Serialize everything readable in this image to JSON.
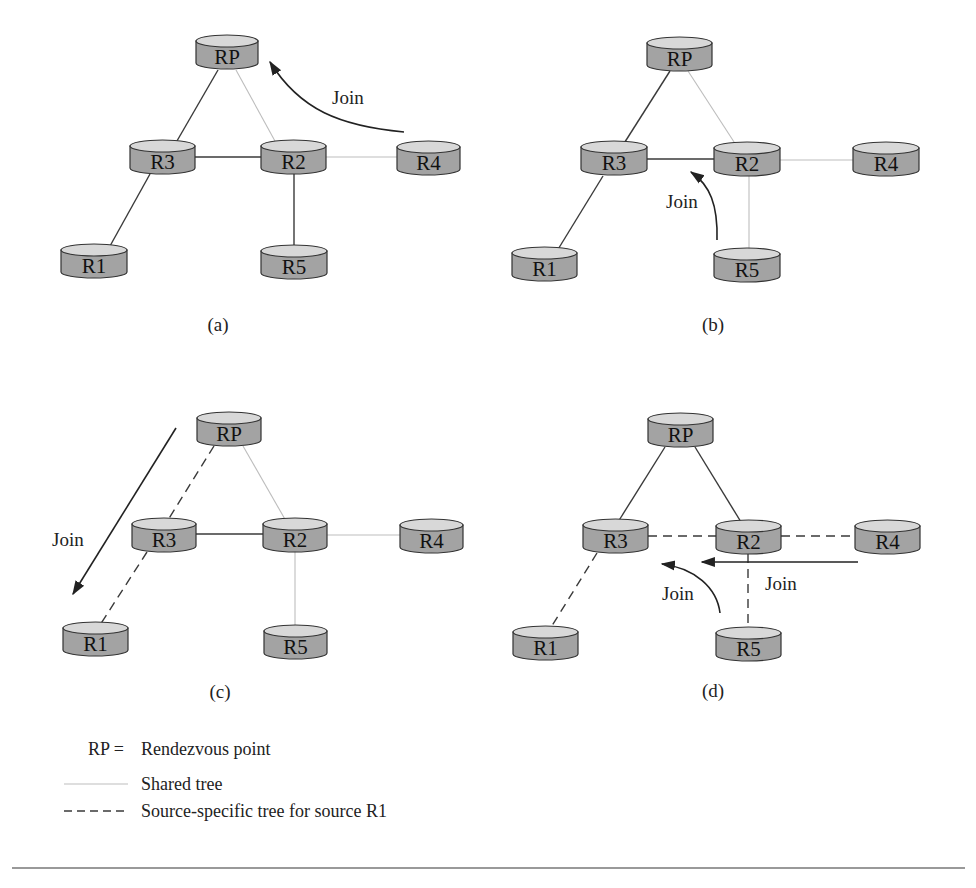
{
  "panels": [
    {
      "id": "a",
      "caption": "(a)",
      "caption_pos": [
        218,
        331
      ],
      "nodes": [
        {
          "id": "RP",
          "label": "RP",
          "x": 196,
          "y": 35,
          "w": 62
        },
        {
          "id": "R3",
          "label": "R3",
          "x": 130,
          "y": 140,
          "w": 65
        },
        {
          "id": "R2",
          "label": "R2",
          "x": 261,
          "y": 140,
          "w": 65
        },
        {
          "id": "R4",
          "label": "R4",
          "x": 397,
          "y": 141,
          "w": 63
        },
        {
          "id": "R1",
          "label": "R1",
          "x": 61,
          "y": 244,
          "w": 66
        },
        {
          "id": "R5",
          "label": "R5",
          "x": 261,
          "y": 245,
          "w": 66
        }
      ],
      "links": [
        {
          "from": "RP",
          "to": "R3",
          "style": "solid",
          "p": [
            218,
            70,
            170,
            153
          ]
        },
        {
          "from": "RP",
          "to": "R2",
          "style": "shared",
          "p": [
            236,
            70,
            281,
            152
          ]
        },
        {
          "from": "R3",
          "to": "R2",
          "style": "solid",
          "p": [
            195,
            157,
            261,
            157
          ]
        },
        {
          "from": "R2",
          "to": "R4",
          "style": "shared",
          "p": [
            326,
            157,
            397,
            157
          ]
        },
        {
          "from": "R2",
          "to": "R5",
          "style": "solid",
          "p": [
            294,
            174,
            294,
            255
          ]
        },
        {
          "from": "R3",
          "to": "R1",
          "style": "solid",
          "p": [
            150,
            174,
            105,
            255
          ]
        }
      ],
      "arrows": [
        {
          "label": "Join",
          "path": "M404,132 C340,126 300,110 270,62",
          "tip": [
            268,
            59
          ],
          "angle": -118,
          "label_pos": [
            332,
            104
          ]
        }
      ]
    },
    {
      "id": "b",
      "caption": "(b)",
      "caption_pos": [
        713,
        331
      ],
      "nodes": [
        {
          "id": "RP",
          "label": "RP",
          "x": 647,
          "y": 37,
          "w": 65
        },
        {
          "id": "R3",
          "label": "R3",
          "x": 581,
          "y": 141,
          "w": 66
        },
        {
          "id": "R2",
          "label": "R2",
          "x": 714,
          "y": 142,
          "w": 66
        },
        {
          "id": "R4",
          "label": "R4",
          "x": 853,
          "y": 142,
          "w": 66
        },
        {
          "id": "R1",
          "label": "R1",
          "x": 512,
          "y": 247,
          "w": 65
        },
        {
          "id": "R5",
          "label": "R5",
          "x": 714,
          "y": 248,
          "w": 66
        }
      ],
      "links": [
        {
          "from": "RP",
          "to": "R3",
          "style": "solid",
          "p": [
            670,
            71,
            623,
            145
          ]
        },
        {
          "from": "RP",
          "to": "R2",
          "style": "shared",
          "p": [
            688,
            71,
            736,
            145
          ]
        },
        {
          "from": "R3",
          "to": "R2",
          "style": "solid",
          "p": [
            647,
            159,
            714,
            159
          ]
        },
        {
          "from": "R2",
          "to": "R4",
          "style": "shared",
          "p": [
            780,
            160,
            853,
            160
          ]
        },
        {
          "from": "R2",
          "to": "R5",
          "style": "shared",
          "p": [
            749,
            176,
            749,
            252
          ]
        },
        {
          "from": "R3",
          "to": "R1",
          "style": "solid",
          "p": [
            603,
            176,
            557,
            251
          ]
        }
      ],
      "arrows": [
        {
          "label": "Join",
          "path": "M717,240 C718,205 710,185 691,172",
          "tip": [
            688,
            169
          ],
          "angle": -140,
          "label_pos": [
            666,
            208
          ]
        }
      ]
    },
    {
      "id": "c",
      "caption": "(c)",
      "caption_pos": [
        220,
        698
      ],
      "nodes": [
        {
          "id": "RP",
          "label": "RP",
          "x": 197,
          "y": 412,
          "w": 64
        },
        {
          "id": "R3",
          "label": "R3",
          "x": 132,
          "y": 518,
          "w": 64
        },
        {
          "id": "R2",
          "label": "R2",
          "x": 263,
          "y": 518,
          "w": 64
        },
        {
          "id": "R4",
          "label": "R4",
          "x": 400,
          "y": 519,
          "w": 63
        },
        {
          "id": "R1",
          "label": "R1",
          "x": 63,
          "y": 622,
          "w": 65
        },
        {
          "id": "R5",
          "label": "R5",
          "x": 264,
          "y": 625,
          "w": 63
        }
      ],
      "links": [
        {
          "from": "RP",
          "to": "R3",
          "style": "dashed",
          "p": [
            214,
            446,
            168,
            520
          ]
        },
        {
          "from": "RP",
          "to": "R2",
          "style": "shared",
          "p": [
            243,
            446,
            286,
            521
          ]
        },
        {
          "from": "R3",
          "to": "R2",
          "style": "solid",
          "p": [
            196,
            534,
            263,
            534
          ]
        },
        {
          "from": "R2",
          "to": "R4",
          "style": "shared",
          "p": [
            327,
            535,
            400,
            535
          ]
        },
        {
          "from": "R2",
          "to": "R5",
          "style": "shared",
          "p": [
            295,
            552,
            295,
            628
          ]
        },
        {
          "from": "R3",
          "to": "R1",
          "style": "dashed",
          "p": [
            147,
            552,
            100,
            625
          ]
        }
      ],
      "arrows": [
        {
          "label": "Join",
          "path": "M176,428 L73,594",
          "tip": [
            70,
            598
          ],
          "angle": 121.8,
          "label_pos": [
            52,
            546
          ]
        }
      ]
    },
    {
      "id": "d",
      "caption": "(d)",
      "caption_pos": [
        713,
        697
      ],
      "nodes": [
        {
          "id": "RP",
          "label": "RP",
          "x": 648,
          "y": 413,
          "w": 65
        },
        {
          "id": "R3",
          "label": "R3",
          "x": 583,
          "y": 519,
          "w": 65
        },
        {
          "id": "R2",
          "label": "R2",
          "x": 716,
          "y": 520,
          "w": 65
        },
        {
          "id": "R4",
          "label": "R4",
          "x": 855,
          "y": 520,
          "w": 65
        },
        {
          "id": "R1",
          "label": "R1",
          "x": 513,
          "y": 626,
          "w": 65
        },
        {
          "id": "R5",
          "label": "R5",
          "x": 716,
          "y": 627,
          "w": 65
        }
      ],
      "links": [
        {
          "from": "RP",
          "to": "R3",
          "style": "solid",
          "p": [
            665,
            447,
            618,
            522
          ]
        },
        {
          "from": "RP",
          "to": "R2",
          "style": "solid",
          "p": [
            695,
            447,
            741,
            522
          ]
        },
        {
          "from": "R3",
          "to": "R2",
          "style": "dashed",
          "p": [
            648,
            536,
            716,
            536
          ]
        },
        {
          "from": "R2",
          "to": "R4",
          "style": "dashed",
          "p": [
            781,
            536,
            855,
            536
          ]
        },
        {
          "from": "R2",
          "to": "R5",
          "style": "dashed",
          "p": [
            748,
            554,
            748,
            630
          ]
        },
        {
          "from": "R3",
          "to": "R1",
          "style": "dashed",
          "p": [
            597,
            553,
            550,
            629
          ]
        }
      ],
      "arrows": [
        {
          "label": "Join",
          "path": "M858,562 L702,562",
          "tip": [
            698,
            562
          ],
          "angle": 180,
          "label_pos": [
            765,
            590
          ]
        },
        {
          "label": "Join",
          "path": "M720,613 C717,588 695,568 662,564",
          "tip": [
            658,
            564
          ],
          "angle": 180,
          "label_pos": [
            662,
            600
          ]
        }
      ]
    }
  ],
  "legend": {
    "rp_key": "RP =",
    "rp_desc": "Rendezvous point",
    "shared_desc": "Shared tree",
    "source_desc": "Source-specific tree for source R1"
  },
  "colors": {
    "node_body": "#a3a3a3",
    "node_top": "#d8d8d8",
    "solid_link": "#3a3a3a",
    "shared_link": "#bdbdbd"
  }
}
